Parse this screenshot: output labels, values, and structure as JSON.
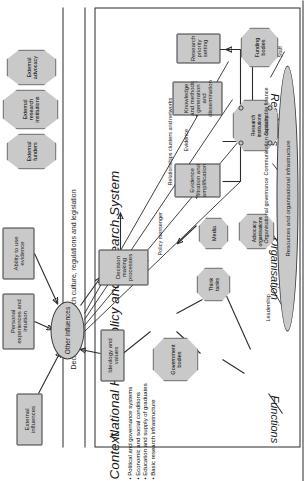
{
  "figure": {
    "title": "National Health Policy and Research System",
    "context_label": "Context",
    "context_bullets": [
      "Political and governance systems",
      "Economic and social conditions",
      "Education and supply of graduates",
      "Basic research infrastructure"
    ],
    "culture_banner": "Decision and Research culture, regulations and legislation",
    "row_labels": [
      "Functions",
      "Organisation",
      "Resources"
    ]
  },
  "influences": {
    "hub": "Other influences",
    "external": "External influences",
    "personal": "Personal experiences and intuition",
    "ability": "Ability to use evidence",
    "ideology": "Ideology and values"
  },
  "external_actors": [
    {
      "label": "External funders"
    },
    {
      "label": "External research institutions"
    },
    {
      "label": "External advocacy"
    }
  ],
  "functions": {
    "decision_making": "Decision making processes",
    "policy_messenger": "Policy messenger",
    "evidence_filtration": "Evidence filtration and amplification",
    "evidence": "Evidence",
    "knowledge": "Knowledge and methods generation and dissemination",
    "priority_setting": "Research priority setting"
  },
  "organisation": {
    "government_bodies": "Government bodies",
    "think_tanks": "Think tanks",
    "media": "Media",
    "advocacy_organisations": "Advocacy organisations",
    "research_institutions": "Research institutions",
    "funding_bodies": "Funding bodies",
    "relationships": "Relationships clusters and networks"
  },
  "resources": {
    "core": "Resources and organisational infrastructure",
    "leadership": "Leadership",
    "organisational_governance": "Organisational governance",
    "communication_capacity": "Communication capacity",
    "sustainable_finance": "Sustainable finance",
    "staff": "Staff"
  },
  "colors": {
    "node_fill": "#c9c9c9",
    "stroke": "#2b2b2b",
    "text": "#1a1a1a",
    "background": "#ffffff"
  }
}
